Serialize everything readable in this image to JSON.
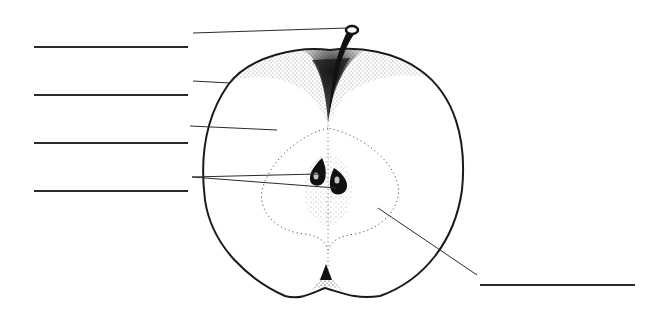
{
  "diagram": {
    "type": "labeling worksheet",
    "answer_blanks": [
      {
        "id": "blank-1",
        "side": "left",
        "x1": 34,
        "x2": 188,
        "y": 47,
        "value": "",
        "points_to": "stem"
      },
      {
        "id": "blank-2",
        "side": "left",
        "x1": 34,
        "x2": 188,
        "y": 95,
        "value": "",
        "points_to": "skin"
      },
      {
        "id": "blank-3",
        "side": "left",
        "x1": 34,
        "x2": 188,
        "y": 143,
        "value": "",
        "points_to": "flesh"
      },
      {
        "id": "blank-4",
        "side": "left",
        "x1": 34,
        "x2": 188,
        "y": 191,
        "value": "",
        "points_to": "seeds"
      },
      {
        "id": "blank-5",
        "side": "right",
        "x1": 480,
        "x2": 635,
        "y": 285,
        "value": "",
        "points_to": "core"
      }
    ],
    "leader_lines": [
      {
        "target": "stem",
        "from": [
          193,
          33
        ],
        "to": [
          350,
          28
        ]
      },
      {
        "target": "skin",
        "from": [
          193,
          81
        ],
        "to": [
          230,
          83
        ]
      },
      {
        "target": "flesh",
        "from": [
          190,
          126
        ],
        "to": [
          277,
          130
        ]
      },
      {
        "target": "seed-upper",
        "from": [
          192,
          177
        ],
        "to": [
          318,
          174
        ]
      },
      {
        "target": "seed-lower",
        "from": [
          192,
          177
        ],
        "to": [
          336,
          188
        ]
      },
      {
        "target": "core",
        "from": [
          378,
          208
        ],
        "to": [
          477,
          275
        ]
      }
    ],
    "colors": {
      "ink": "#1a1a1a",
      "line": "#2a2a2a",
      "background": "#ffffff"
    }
  }
}
